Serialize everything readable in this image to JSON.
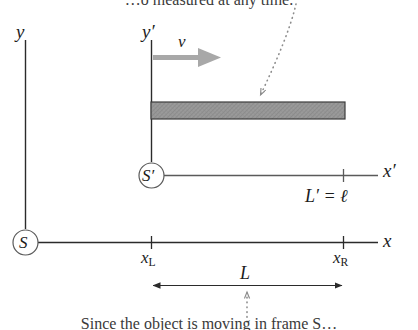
{
  "figure": {
    "colors": {
      "axis": "#2b2b2b",
      "bar_fill": "#9a9a9a",
      "bar_stroke": "#3c3c3c",
      "velocity_arrow": "#a8a8a8",
      "dotted_leader": "#8c8c8c",
      "text": "#1c1c1c",
      "caption_text": "#3a3a3a",
      "background": "#ffffff"
    }
  },
  "frame_S": {
    "origin_label": "S",
    "y_axis_label": "y",
    "x_axis_label": "x",
    "tick_left_label": "x",
    "tick_left_sub": "L",
    "tick_right_label": "x",
    "tick_right_sub": "R",
    "measured_length_label": "L"
  },
  "frame_Sprime": {
    "origin_label": "S′",
    "y_axis_label": "y′",
    "x_axis_label": "x′",
    "velocity_label": "v",
    "proper_length_label": "L′ = ℓ"
  },
  "captions": {
    "top": "…o measured at any time.",
    "bottom": "Since the object is moving in frame S…"
  }
}
